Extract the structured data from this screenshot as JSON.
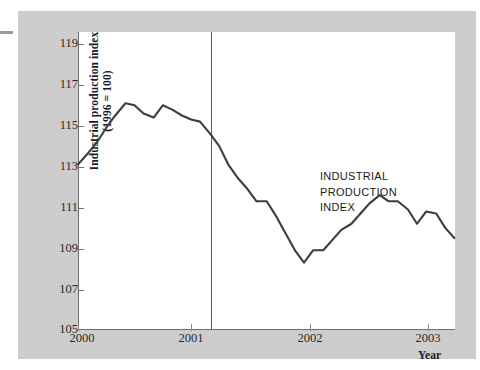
{
  "chart_data": {
    "type": "line",
    "title": "",
    "ylabel_line1": "Industrial production index",
    "ylabel_line2": "(1996 = 100)",
    "xlabel": "Year",
    "ylim": [
      105,
      119
    ],
    "xlim": [
      2000.0,
      2003.33
    ],
    "yticks": [
      105,
      107,
      109,
      111,
      113,
      115,
      117,
      119
    ],
    "ytick_labels": [
      "105",
      "107",
      "109",
      "111",
      "113",
      "115",
      "117",
      "119"
    ],
    "xticks": [
      2000,
      2001,
      2002,
      2003
    ],
    "xtick_labels": [
      "2000",
      "2001",
      "2002",
      "2003"
    ],
    "grid": false,
    "legend": "none",
    "series": [
      {
        "name": "INDUSTRIAL PRODUCTION INDEX",
        "x": [
          2000.0,
          2000.08,
          2000.17,
          2000.25,
          2000.33,
          2000.42,
          2000.5,
          2000.58,
          2000.67,
          2000.75,
          2000.83,
          2000.92,
          2001.0,
          2001.08,
          2001.17,
          2001.25,
          2001.33,
          2001.42,
          2001.5,
          2001.58,
          2001.67,
          2001.75,
          2001.83,
          2001.92,
          2002.0,
          2002.08,
          2002.17,
          2002.25,
          2002.33,
          2002.42,
          2002.5,
          2002.58,
          2002.67,
          2002.75,
          2002.83,
          2002.92,
          2003.0,
          2003.08,
          2003.17,
          2003.25,
          2003.33
        ],
        "y": [
          113.1,
          113.6,
          114.2,
          114.9,
          115.5,
          116.1,
          116.0,
          115.6,
          115.4,
          116.0,
          115.8,
          115.5,
          115.3,
          115.2,
          114.6,
          114.0,
          113.1,
          112.4,
          111.9,
          111.3,
          111.3,
          110.6,
          109.8,
          108.9,
          108.3,
          108.9,
          108.9,
          109.4,
          109.9,
          110.2,
          110.7,
          111.2,
          111.6,
          111.3,
          111.3,
          110.9,
          110.2,
          110.8,
          110.7,
          110.0,
          109.5
        ]
      }
    ],
    "annotations": [
      {
        "text": "INDUSTRIAL\nPRODUCTION\nINDEX",
        "x": 2002.13,
        "y": 112.9
      }
    ],
    "vertical_markers": [
      {
        "label": "recession start",
        "x": 2001.19
      }
    ],
    "line_color": "#3d3d3d",
    "panel_color": "#cdcdcd",
    "plot_background": "#ffffff",
    "axis_color": "#6f6f6f"
  }
}
